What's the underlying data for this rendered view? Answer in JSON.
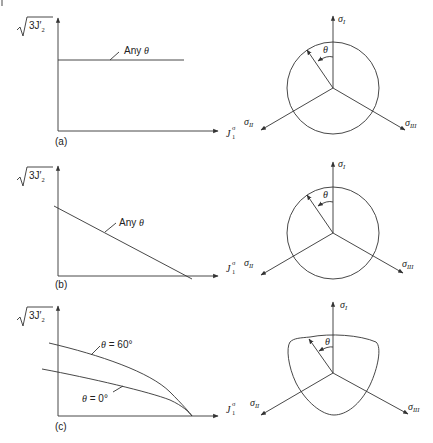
{
  "figure": {
    "panels": [
      {
        "id": "a",
        "tag": "(a)",
        "y_axis_label": "√3J'₂",
        "x_axis_label": "J₁σ",
        "curve_labels": [
          "Any θ"
        ],
        "description": "Horizontal line — yield independent of J1 (Tresca / von Mises)",
        "deviatoric_shape": "circle",
        "axes": [
          "σI",
          "σII",
          "σIII"
        ],
        "angle_label": "θ"
      },
      {
        "id": "b",
        "tag": "(b)",
        "y_axis_label": "√3J'₂",
        "x_axis_label": "J₁σ",
        "curve_labels": [
          "Any θ"
        ],
        "description": "Straight line decreasing with J1 (Drucker–Prager)",
        "deviatoric_shape": "circle",
        "axes": [
          "σI",
          "σII",
          "σIII"
        ],
        "angle_label": "θ"
      },
      {
        "id": "c",
        "tag": "(c)",
        "y_axis_label": "√3J'₂",
        "x_axis_label": "J₁σ",
        "curve_labels": [
          "θ = 60°",
          "θ = 0°"
        ],
        "description": "Curved meridians depending on Lode angle θ",
        "deviatoric_shape": "rounded-triangle",
        "axes": [
          "σI",
          "σII",
          "σIII"
        ],
        "angle_label": "θ"
      }
    ],
    "labels": {
      "sqrt_prefix": "3J",
      "prime_sub": "2",
      "j_main": "J",
      "j_sup": "σ",
      "j_sub": "1",
      "sigma": "σ",
      "sub_I": "I",
      "sub_II": "II",
      "sub_III": "III",
      "theta": "θ",
      "any_theta_text": "Any ",
      "theta60_text": " = 60°",
      "theta0_text": " = 0°",
      "tag_a": "(a)",
      "tag_b": "(b)",
      "tag_c": "(c)"
    }
  }
}
